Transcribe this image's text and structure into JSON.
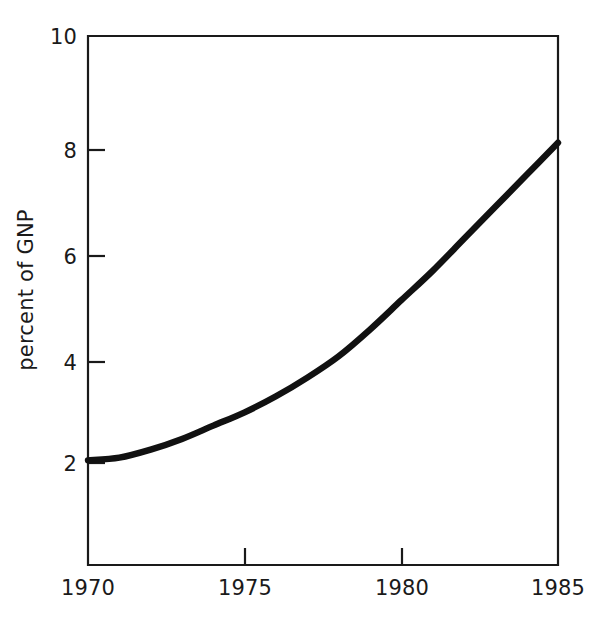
{
  "chart_data": {
    "type": "line",
    "title": "",
    "xlabel": "",
    "ylabel": "percent of GNP",
    "xlim": [
      1970,
      1985
    ],
    "ylim": [
      0.1,
      10
    ],
    "grid": false,
    "legend": "none",
    "x_ticks": [
      "1970",
      "1975",
      "1980",
      "1985"
    ],
    "x_tick_values": [
      1970,
      1975,
      1980,
      1985
    ],
    "y_ticks": [
      "2",
      "4",
      "6",
      "8",
      "10"
    ],
    "y_tick_values": [
      2,
      4,
      6,
      8,
      10
    ],
    "series": [
      {
        "name": "percent of GNP",
        "color": "#111111",
        "x": [
          1970,
          1971,
          1972,
          1973,
          1974,
          1975,
          1976,
          1977,
          1978,
          1979,
          1980,
          1981,
          1982,
          1983,
          1984,
          1985
        ],
        "values": [
          2.05,
          2.1,
          2.25,
          2.45,
          2.7,
          2.95,
          3.25,
          3.6,
          4.0,
          4.5,
          5.05,
          5.6,
          6.2,
          6.8,
          7.4,
          8.0
        ]
      }
    ],
    "annotations": []
  },
  "axis": {
    "y_label": "percent of GNP",
    "tick_1970": "1970",
    "tick_1975": "1975",
    "tick_1980": "1980",
    "tick_1985": "1985",
    "tick_2": "2",
    "tick_4": "4",
    "tick_6": "6",
    "tick_8": "8",
    "tick_10": "10"
  },
  "colors": {
    "curve": "#111111",
    "axis": "#1a1a1a",
    "background": "#ffffff"
  }
}
